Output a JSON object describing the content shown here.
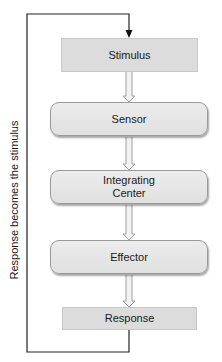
{
  "diagram": {
    "type": "flowchart",
    "title": "",
    "nodes": [
      {
        "id": "stimulus",
        "label": "Stimulus",
        "shape": "rectangle"
      },
      {
        "id": "sensor",
        "label": "Sensor",
        "shape": "rounded"
      },
      {
        "id": "integrating_center",
        "label": "Integrating\nCenter",
        "shape": "rounded"
      },
      {
        "id": "effector",
        "label": "Effector",
        "shape": "rounded"
      },
      {
        "id": "response",
        "label": "Response",
        "shape": "rectangle"
      }
    ],
    "edges": [
      {
        "from": "stimulus",
        "to": "sensor",
        "style": "hollow-block-arrow"
      },
      {
        "from": "sensor",
        "to": "integrating_center",
        "style": "hollow-block-arrow"
      },
      {
        "from": "integrating_center",
        "to": "effector",
        "style": "hollow-block-arrow"
      },
      {
        "from": "effector",
        "to": "response",
        "style": "hollow-block-arrow"
      },
      {
        "from": "response",
        "to": "stimulus",
        "style": "feedback-line",
        "label": "Response becomes the stimulus"
      }
    ],
    "feedback_label": "Response becomes the stimulus",
    "colors": {
      "rect_fill": "#dcdcdc",
      "rounded_fill": "#e6e6e6",
      "border": "#9a9a9a",
      "line": "#222222",
      "arrow_outline": "#a0a0a0"
    }
  }
}
